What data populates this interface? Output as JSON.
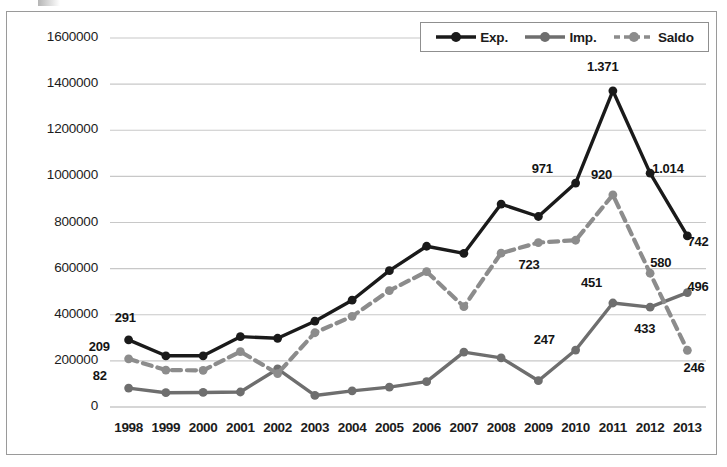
{
  "chart_data": {
    "type": "line",
    "title": "",
    "xlabel": "",
    "ylabel": "",
    "ylim": [
      0,
      1600000
    ],
    "ytick_step": 200000,
    "grid": true,
    "legend_position": "top-right",
    "categories": [
      "1998",
      "1999",
      "2000",
      "2001",
      "2002",
      "2003",
      "2004",
      "2005",
      "2006",
      "2007",
      "2008",
      "2009",
      "2010",
      "2011",
      "2012",
      "2013"
    ],
    "series": [
      {
        "name": "Exp.",
        "color": "#1a1a1a",
        "style": "solid",
        "values": [
          291000,
          222000,
          222000,
          305000,
          298000,
          372000,
          463000,
          591000,
          697000,
          666000,
          880000,
          826000,
          971000,
          1371000,
          1014000,
          742000
        ]
      },
      {
        "name": "Imp.",
        "color": "#6e6e6e",
        "style": "solid",
        "values": [
          82000,
          62000,
          63000,
          65000,
          165000,
          50000,
          70000,
          86000,
          110000,
          238000,
          213000,
          114000,
          247000,
          451000,
          433000,
          496000
        ]
      },
      {
        "name": "Saldo",
        "color": "#8c8c8c",
        "style": "dashed",
        "values": [
          209000,
          160000,
          159000,
          240000,
          145000,
          322000,
          393000,
          505000,
          587000,
          435000,
          667000,
          713000,
          723000,
          920000,
          580000,
          246000
        ]
      }
    ],
    "ytick_labels": [
      "0",
      "200000",
      "400000",
      "600000",
      "800000",
      "1000000",
      "1200000",
      "1400000",
      "1600000"
    ],
    "point_labels": [
      {
        "series": "Exp.",
        "category": "1998",
        "text": "291",
        "dx": -6,
        "dy": -22
      },
      {
        "series": "Saldo",
        "category": "1998",
        "text": "209",
        "dx": -32,
        "dy": -12
      },
      {
        "series": "Imp.",
        "category": "1998",
        "text": "82",
        "dx": -28,
        "dy": -12
      },
      {
        "series": "Exp.",
        "category": "2010",
        "text": "971",
        "dx": -36,
        "dy": -14
      },
      {
        "series": "Exp.",
        "category": "2011",
        "text": "1.371",
        "dx": -18,
        "dy": -24
      },
      {
        "series": "Exp.",
        "category": "2012",
        "text": "1.014",
        "dx": 10,
        "dy": -4
      },
      {
        "series": "Exp.",
        "category": "2013",
        "text": "742",
        "dx": 8,
        "dy": 6
      },
      {
        "series": "Saldo",
        "category": "2009",
        "text": "723",
        "dx": -12,
        "dy": 22
      },
      {
        "series": "Saldo",
        "category": "2011",
        "text": "920",
        "dx": -14,
        "dy": -20
      },
      {
        "series": "Saldo",
        "category": "2012",
        "text": "580",
        "dx": 8,
        "dy": -10
      },
      {
        "series": "Saldo",
        "category": "2013",
        "text": "246",
        "dx": 4,
        "dy": 18
      },
      {
        "series": "Imp.",
        "category": "2010",
        "text": "247",
        "dx": -34,
        "dy": -10
      },
      {
        "series": "Imp.",
        "category": "2011",
        "text": "451",
        "dx": -24,
        "dy": -20
      },
      {
        "series": "Imp.",
        "category": "2012",
        "text": "433",
        "dx": -8,
        "dy": 22
      },
      {
        "series": "Imp.",
        "category": "2013",
        "text": "496",
        "dx": 8,
        "dy": -6
      }
    ]
  },
  "legend": {
    "items": [
      {
        "label": "Exp.",
        "icon": "line-marker-solid-black"
      },
      {
        "label": "Imp.",
        "icon": "line-marker-solid-gray"
      },
      {
        "label": "Saldo",
        "icon": "line-marker-dashed-gray"
      }
    ]
  }
}
